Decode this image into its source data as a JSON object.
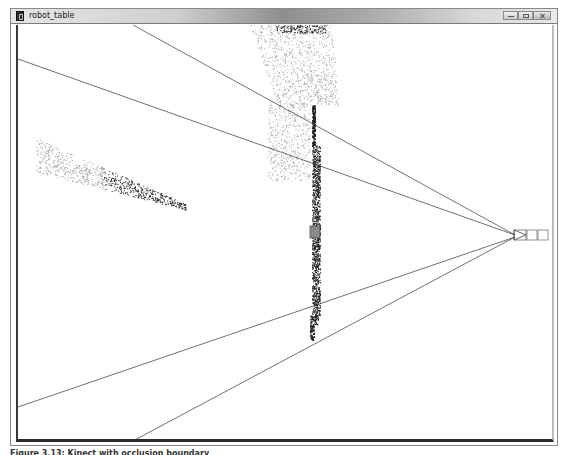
{
  "window": {
    "title": "robot_table",
    "controls": {
      "minimize": "minimize",
      "maximize": "maximize",
      "close": "close"
    }
  },
  "scene": {
    "description": "3D point cloud viewer showing sensor view frustum, table point cloud and scattered points",
    "colors": {
      "background": "#ffffff",
      "frustum_lines": "#333333",
      "light_points": "#9a9a9a",
      "dark_points": "#1e1e1e",
      "marker_box": "#7a7a7a"
    }
  },
  "caption": {
    "text": "Figure 3.13: Kinect with occlusion boundary"
  }
}
